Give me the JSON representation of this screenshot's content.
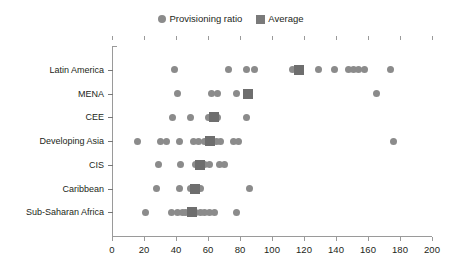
{
  "legend": {
    "entries": [
      {
        "label": "Provisioning ratio",
        "marker": "circle-marker-icon",
        "color": "#8b8b8b"
      },
      {
        "label": "Average",
        "marker": "square-marker-icon",
        "color": "#7a7a7a"
      }
    ]
  },
  "axes": {
    "x_ticks": [
      "0",
      "20",
      "40",
      "60",
      "80",
      "100",
      "120",
      "140",
      "160",
      "180",
      "200"
    ],
    "x_min": 0,
    "x_max": 200,
    "x_step": 20
  },
  "chart_data": {
    "type": "scatter",
    "title": "",
    "subtitle": "",
    "xlabel": "",
    "ylabel": "",
    "xlim": [
      0,
      200
    ],
    "xticks": [
      0,
      20,
      40,
      60,
      80,
      100,
      120,
      140,
      160,
      180,
      200
    ],
    "grid": false,
    "legend_position": "top-center",
    "categories": [
      "Latin America",
      "MENA",
      "CEE",
      "Developing Asia",
      "CIS",
      "Caribbean",
      "Sub-Saharan Africa"
    ],
    "series": [
      {
        "name": "Provisioning ratio",
        "marker": "circle",
        "color": "#8b8b8b",
        "points_by_category": {
          "Latin America": [
            39,
            73,
            84,
            89,
            113,
            118,
            129,
            139,
            148,
            151,
            154,
            158,
            174
          ],
          "MENA": [
            41,
            62,
            66,
            78,
            165
          ],
          "CEE": [
            38,
            49,
            60,
            63,
            66,
            84
          ],
          "Developing Asia": [
            16,
            30,
            34,
            42,
            51,
            54,
            58,
            60,
            62,
            65,
            68,
            76,
            79,
            176
          ],
          "CIS": [
            29,
            43,
            52,
            55,
            58,
            61,
            67,
            70
          ],
          "Caribbean": [
            28,
            42,
            49,
            52,
            55,
            86
          ],
          "Sub-Saharan Africa": [
            21,
            37,
            41,
            44,
            46,
            49,
            52,
            55,
            58,
            61,
            64,
            78
          ]
        }
      },
      {
        "name": "Average",
        "marker": "square",
        "color": "#6e6e6e",
        "points_by_category": {
          "Latin America": [
            117
          ],
          "MENA": [
            85
          ],
          "CEE": [
            64
          ],
          "Developing Asia": [
            61
          ],
          "CIS": [
            55
          ],
          "Caribbean": [
            52
          ],
          "Sub-Saharan Africa": [
            50
          ]
        }
      }
    ]
  }
}
